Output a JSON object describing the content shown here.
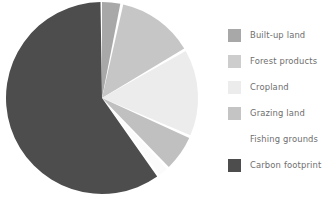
{
  "chart_data": {
    "type": "pie",
    "title": "",
    "subtitle": "",
    "legend_position": "right",
    "grid": false,
    "start_angle_deg": 0,
    "direction": "clockwise",
    "categories": [
      "Built-up land",
      "Forest products",
      "Cropland",
      "Grazing land",
      "Fishing grounds",
      "Carbon footprint"
    ],
    "values": [
      3.3,
      13.3,
      15.0,
      6.4,
      2.0,
      60.0
    ],
    "unit": "percent",
    "colors": [
      "#a8a8a8",
      "#c6c6c6",
      "#ececec",
      "#c0c0c0",
      "#fbfbfb",
      "#4d4d4d"
    ],
    "slices": [
      {
        "label": "Built-up land",
        "value": 3.3,
        "color": "#a8a8a8",
        "start_deg": 0.0,
        "end_deg": 11.9
      },
      {
        "label": "Forest products",
        "value": 13.3,
        "color": "#c6c6c6",
        "start_deg": 11.9,
        "end_deg": 59.8
      },
      {
        "label": "Cropland",
        "value": 15.0,
        "color": "#ececec",
        "start_deg": 59.8,
        "end_deg": 113.8
      },
      {
        "label": "Grazing land",
        "value": 6.4,
        "color": "#c0c0c0",
        "start_deg": 113.8,
        "end_deg": 136.8
      },
      {
        "label": "Fishing grounds",
        "value": 2.0,
        "color": "#fbfbfb",
        "start_deg": 136.8,
        "end_deg": 144.0
      },
      {
        "label": "Carbon footprint",
        "value": 60.0,
        "color": "#4d4d4d",
        "start_deg": 144.0,
        "end_deg": 360.0
      }
    ]
  },
  "legend": {
    "items": [
      {
        "label": "Built-up land",
        "color": "#a8a8a8"
      },
      {
        "label": "Forest products",
        "color": "#cdcdcd"
      },
      {
        "label": "Cropland",
        "color": "#ececec"
      },
      {
        "label": "Grazing land",
        "color": "#c4c4c4"
      },
      {
        "label": "Fishing grounds",
        "color": "#ffffff"
      },
      {
        "label": "Carbon footprint",
        "color": "#4d4d4d"
      }
    ]
  },
  "geometry": {
    "center_x": 102,
    "center_y": 98,
    "radius": 96,
    "gap_deg": 1.8
  }
}
